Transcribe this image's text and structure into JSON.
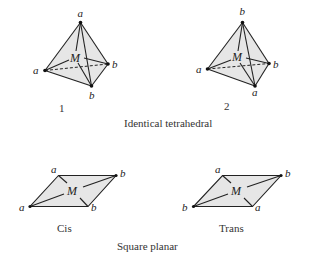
{
  "figure": {
    "sections": [
      {
        "title": "Identical tetrahedral",
        "diagrams": [
          {
            "id": "tetrahedral-1",
            "number_label": "1",
            "center_label": "M",
            "vertices": {
              "top": "a",
              "left": "a",
              "right": "b",
              "bottom": "b"
            }
          },
          {
            "id": "tetrahedral-2",
            "number_label": "2",
            "center_label": "M",
            "vertices": {
              "top": "b",
              "left": "a",
              "right": "b",
              "bottom": "a"
            }
          }
        ]
      },
      {
        "title": "Square planar",
        "diagrams": [
          {
            "id": "square-planar-cis",
            "caption": "Cis",
            "center_label": "M",
            "vertices": {
              "top_left": "a",
              "top_right": "b",
              "bottom_left": "a",
              "bottom_right": "b"
            }
          },
          {
            "id": "square-planar-trans",
            "caption": "Trans",
            "center_label": "M",
            "vertices": {
              "top_left": "a",
              "top_right": "b",
              "bottom_left": "b",
              "bottom_right": "a"
            }
          }
        ]
      }
    ]
  }
}
